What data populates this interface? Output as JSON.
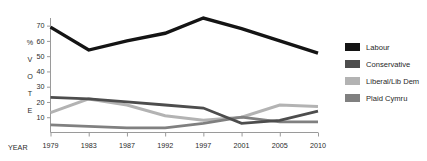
{
  "chart_data": {
    "type": "line",
    "title": "",
    "xlabel": "YEAR",
    "ylabel": "% VOTE",
    "ylabel_letters": [
      "%",
      "V",
      "O",
      "T",
      "E"
    ],
    "categories": [
      "1979",
      "1983",
      "1987",
      "1992",
      "1997",
      "2001",
      "2005",
      "2010"
    ],
    "x": [
      1979,
      1983,
      1987,
      1992,
      1997,
      2001,
      2005,
      2010
    ],
    "ylim": [
      0,
      75
    ],
    "yticks": [
      10,
      20,
      30,
      40,
      50,
      60,
      70
    ],
    "ytick_labels": [
      "10",
      "20",
      "30",
      "40",
      "50",
      "60",
      "70"
    ],
    "grid": false,
    "legend_position": "right",
    "series": [
      {
        "name": "Labour",
        "color": "#141414",
        "values": [
          69,
          54,
          60,
          65,
          75,
          68,
          60,
          52
        ]
      },
      {
        "name": "Conservative",
        "color": "#4d4d4d",
        "values": [
          23,
          22,
          20,
          18,
          16,
          6,
          8,
          14
        ]
      },
      {
        "name": "Liberal/Lib Dem",
        "color": "#b3b3b3",
        "values": [
          13,
          22,
          18,
          11,
          8,
          10,
          18,
          17
        ]
      },
      {
        "name": "Plaid Cymru",
        "color": "#808080",
        "values": [
          5,
          4,
          3,
          3,
          6,
          10,
          7,
          7
        ]
      }
    ]
  },
  "legend": {
    "items": [
      {
        "label": "Labour",
        "color": "#141414"
      },
      {
        "label": "Conservative",
        "color": "#4d4d4d"
      },
      {
        "label": "Liberal/Lib Dem",
        "color": "#b3b3b3"
      },
      {
        "label": "Plaid Cymru",
        "color": "#808080"
      }
    ]
  }
}
